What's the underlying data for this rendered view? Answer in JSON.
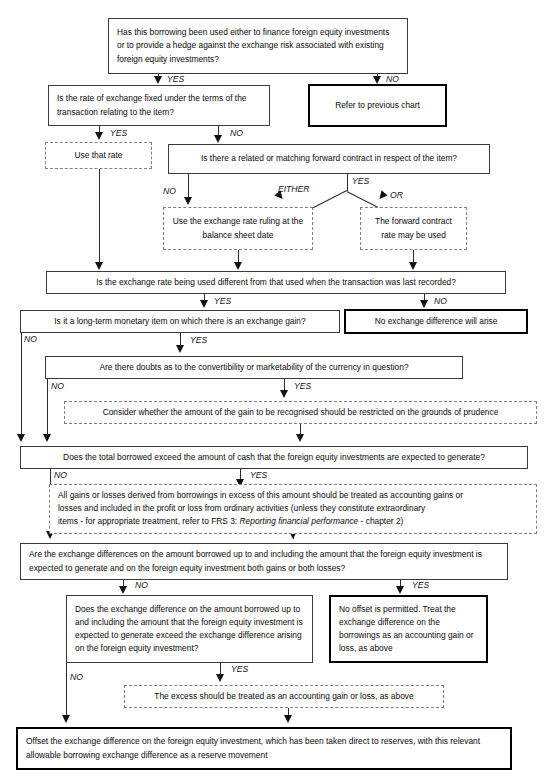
{
  "diagram": {
    "type": "flowchart",
    "nodes": {
      "q_borrowing_used": "Has this borrowing been used either to finance foreign equity investments or to provide a hedge against the exchange risk associated with existing foreign equity investments?",
      "refer_previous": "Refer to previous chart",
      "q_rate_fixed": "Is the rate of exchange fixed under the terms of the transaction relating to the item?",
      "use_that_rate": "Use that rate",
      "q_forward_contract": "Is there a related or matching forward contract in respect of the item?",
      "use_balance_sheet_rate": "Use the exchange rate ruling at the balance sheet date",
      "forward_rate_may_be_used": "The forward contract rate may be used",
      "q_rate_different": "Is the exchange rate being used different from that used when the transaction was last recorded?",
      "no_exchange_difference": "No exchange difference will arise",
      "q_longterm_monetary": "Is it a long-term monetary item on which there is an exchange gain?",
      "q_convertibility_doubts": "Are there doubts as to the convertibility or marketability of the currency in question?",
      "consider_prudence": "Consider whether the amount of the gain to be recognised should be restricted on the grounds of prudence",
      "q_total_borrowed": "Does the total borrowed exceed the amount of cash that the foreign equity investments are expected to generate?",
      "all_gains_losses_1": "All gains or losses derived from borrowings in excess of this amount should be treated as accounting gains or",
      "all_gains_losses_2": "losses and included in the profit or loss from ordinary activities (unless they constitute extraordinary",
      "all_gains_losses_3a": "items - for appropriate treatment,  refer to FRS 3: ",
      "all_gains_losses_3b": "Reporting financial performance",
      "all_gains_losses_3c": " - chapter 2)",
      "q_both_gains_losses": "Are the exchange differences on the amount borrowed up to and including the amount that the foreign equity investment is expected to generate and on the foreign equity investment both gains or both losses?",
      "q_exceed_difference": "Does the exchange difference on the amount borrowed up to and including the amount that the foreign equity investment is expected to generate exceed the exchange difference arising on the foreign equity investment?",
      "no_offset": "No offset is permitted. Treat the exchange difference on the borrowings as an accounting gain or loss, as above",
      "excess_treated": "The excess should be treated as an accounting gain or loss, as above",
      "offset_final": "Offset the exchange difference on the foreign equity investment, which has been taken direct to reserves, with this relevant allowable borrowing exchange difference as a reserve movement"
    },
    "edge_labels": {
      "yes": "YES",
      "no": "NO",
      "either": "EITHER",
      "or": "OR"
    },
    "colors": {
      "line": "#2b2b2b",
      "box_border": "#3a3a3a",
      "emphasis_border": "#000000",
      "dashed_border": "#808080",
      "text": "#0a0a0a",
      "background": "#ffffff"
    }
  }
}
